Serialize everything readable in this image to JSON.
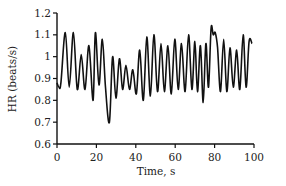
{
  "chart_data": {
    "type": "line",
    "title": "",
    "xlabel": "Time, s",
    "ylabel": "HR (beats/s)",
    "xlim": [
      0,
      100
    ],
    "ylim": [
      0.6,
      1.2
    ],
    "xticks": [
      0,
      20,
      40,
      60,
      80,
      100
    ],
    "yticks": [
      0.6,
      0.7,
      0.8,
      0.9,
      1,
      1.1,
      1.2
    ],
    "xtick_labels": [
      "0",
      "20",
      "40",
      "60",
      "80",
      "100"
    ],
    "ytick_labels": [
      "0.6",
      "0.7",
      "0.8",
      "0.9",
      "1",
      "1.1",
      "1.2"
    ],
    "grid": false,
    "legend": null,
    "line_color": "#111111",
    "series": [
      {
        "name": "HR",
        "x": [
          0,
          1.0,
          2.0,
          4.2,
          6.2,
          8.3,
          10.3,
          12.3,
          14.2,
          16.2,
          18.3,
          19.5,
          21.3,
          23.0,
          24.6,
          26.6,
          28.2,
          29.9,
          31.7,
          33.3,
          35.0,
          36.8,
          38.5,
          40.3,
          42.0,
          43.8,
          45.6,
          47.4,
          49.2,
          51.0,
          52.8,
          54.5,
          56.3,
          58.0,
          59.8,
          61.5,
          63.2,
          65.0,
          66.8,
          68.5,
          70.0,
          71.3,
          72.8,
          74.2,
          75.6,
          76.9,
          78.2,
          79.3,
          80.3,
          81.5,
          83.0,
          84.6,
          86.2,
          87.8,
          89.5,
          91.2,
          92.8,
          94.5,
          96.0,
          97.5,
          99.0
        ],
        "y": [
          0.88,
          0.86,
          0.88,
          1.11,
          0.86,
          1.11,
          0.85,
          1.01,
          0.85,
          1.05,
          0.8,
          1.11,
          0.87,
          1.08,
          0.86,
          0.7,
          1.0,
          0.81,
          0.99,
          0.85,
          0.96,
          0.85,
          0.94,
          0.83,
          1.03,
          0.8,
          1.09,
          0.82,
          1.1,
          0.84,
          1.06,
          0.84,
          1.05,
          0.83,
          1.08,
          0.85,
          1.06,
          0.84,
          1.1,
          0.85,
          1.07,
          0.84,
          1.05,
          0.79,
          1.06,
          0.86,
          1.13,
          1.1,
          1.11,
          1.04,
          0.84,
          1.08,
          0.84,
          1.04,
          0.86,
          1.03,
          0.85,
          1.1,
          0.86,
          1.07,
          1.06
        ]
      }
    ]
  }
}
